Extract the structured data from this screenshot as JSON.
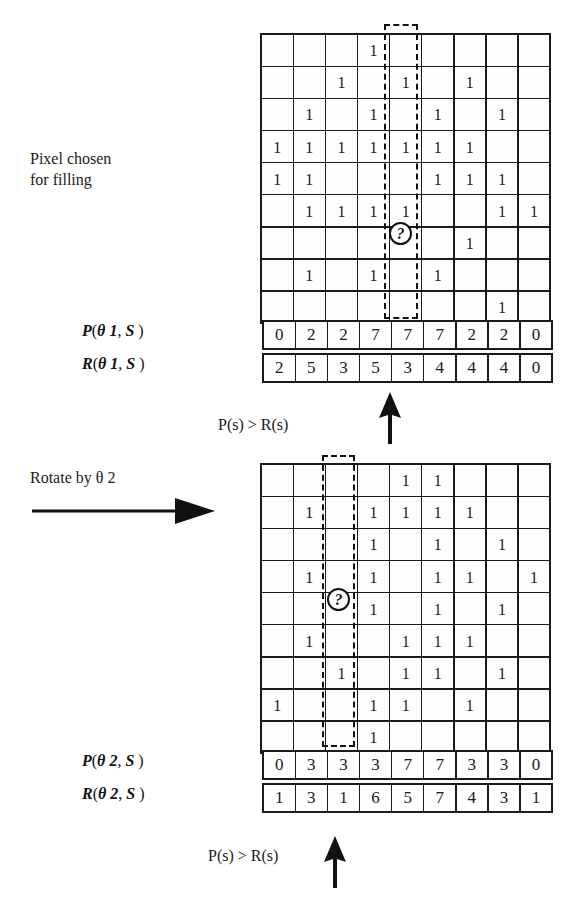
{
  "figure": {
    "pixel_chosen_caption": "Pixel chosen\nfor filling",
    "rotate_caption": "Rotate by  θ 2",
    "comparison_label_1": "P(s)  >  R(s)",
    "comparison_label_2": "P(s)  >  R(s)",
    "marker_symbol": "?"
  },
  "labels": {
    "p1": {
      "fn": "P",
      "open": "(",
      "theta": "θ 1",
      "comma": ", ",
      "s": "S",
      "close": " )"
    },
    "r1": {
      "fn": "R",
      "open": "(",
      "theta": "θ 1",
      "comma": ", ",
      "s": "S",
      "close": " )"
    },
    "p2": {
      "fn": "P",
      "open": "(",
      "theta": "θ 2",
      "comma": ", ",
      "s": "S",
      "close": " )"
    },
    "r2": {
      "fn": "R",
      "open": "(",
      "theta": "θ 2",
      "comma": ", ",
      "s": "S",
      "close": " )"
    }
  },
  "grids": {
    "top": {
      "rows": 9,
      "cols": 9,
      "highlight_column": 5,
      "marker_cell": {
        "row": 7,
        "col": 5
      },
      "on_symbol": "1",
      "cells": [
        [
          0,
          0,
          0,
          1,
          0,
          0,
          0,
          0,
          0
        ],
        [
          0,
          0,
          1,
          0,
          1,
          0,
          1,
          0,
          0
        ],
        [
          0,
          1,
          0,
          1,
          0,
          1,
          0,
          1,
          0
        ],
        [
          1,
          1,
          1,
          1,
          1,
          1,
          1,
          0,
          0
        ],
        [
          1,
          1,
          0,
          0,
          0,
          1,
          1,
          1,
          0
        ],
        [
          0,
          1,
          1,
          1,
          1,
          0,
          0,
          1,
          1
        ],
        [
          0,
          0,
          0,
          0,
          0,
          0,
          1,
          0,
          0
        ],
        [
          0,
          1,
          0,
          1,
          0,
          1,
          0,
          0,
          0
        ],
        [
          0,
          0,
          0,
          0,
          0,
          0,
          0,
          1,
          0
        ]
      ]
    },
    "bottom": {
      "rows": 9,
      "cols": 9,
      "highlight_column": 3,
      "marker_cell": {
        "row": 5,
        "col": 3
      },
      "on_symbol": "1",
      "cells": [
        [
          0,
          0,
          0,
          0,
          1,
          1,
          0,
          0,
          0
        ],
        [
          0,
          1,
          0,
          1,
          1,
          1,
          1,
          0,
          0
        ],
        [
          0,
          0,
          0,
          1,
          0,
          1,
          0,
          1,
          0
        ],
        [
          0,
          1,
          0,
          1,
          0,
          1,
          1,
          0,
          1
        ],
        [
          0,
          0,
          0,
          1,
          0,
          1,
          0,
          1,
          0
        ],
        [
          0,
          1,
          0,
          0,
          1,
          1,
          1,
          0,
          0
        ],
        [
          0,
          0,
          1,
          0,
          1,
          1,
          0,
          1,
          0
        ],
        [
          1,
          0,
          0,
          1,
          1,
          0,
          1,
          0,
          0
        ],
        [
          0,
          0,
          0,
          1,
          0,
          0,
          0,
          0,
          0
        ]
      ]
    }
  },
  "chart_data": {
    "type": "table",
    "series": [
      {
        "name": "P( θ1, S )",
        "values": [
          0,
          2,
          2,
          7,
          7,
          7,
          2,
          2,
          0
        ]
      },
      {
        "name": "R( θ1, S )",
        "values": [
          2,
          5,
          3,
          5,
          3,
          4,
          4,
          4,
          0
        ]
      },
      {
        "name": "P( θ2, S )",
        "values": [
          0,
          3,
          3,
          3,
          7,
          7,
          3,
          3,
          0
        ]
      },
      {
        "name": "R( θ2, S )",
        "values": [
          1,
          3,
          1,
          6,
          5,
          7,
          4,
          3,
          1
        ]
      }
    ],
    "categories": [
      "1",
      "2",
      "3",
      "4",
      "5",
      "6",
      "7",
      "8",
      "9"
    ],
    "xlabel": "s (column index)",
    "ylabel": "count",
    "annotations": [
      "P(s)  >  R(s)",
      "P(s)  >  R(s)",
      "Pixel chosen for filling",
      "Rotate by θ 2"
    ]
  },
  "colors": {
    "ink": "#1a1a1a",
    "paper": "#ffffff",
    "cell": "#fefefe"
  }
}
